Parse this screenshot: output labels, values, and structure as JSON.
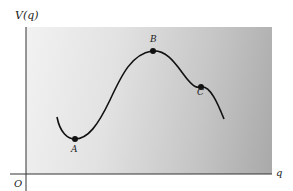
{
  "figure": {
    "y_axis_label": "V(q)",
    "x_axis_label": "q",
    "origin_label": "O",
    "points": [
      {
        "label": "A",
        "role": "local minimum"
      },
      {
        "label": "B",
        "role": "local maximum"
      },
      {
        "label": "C",
        "role": "inflection / shoulder"
      }
    ],
    "colors": {
      "curve": "#111111",
      "panel_light": "#f2f2f2",
      "panel_dark": "#a9a9a9",
      "axis": "#333333"
    }
  }
}
